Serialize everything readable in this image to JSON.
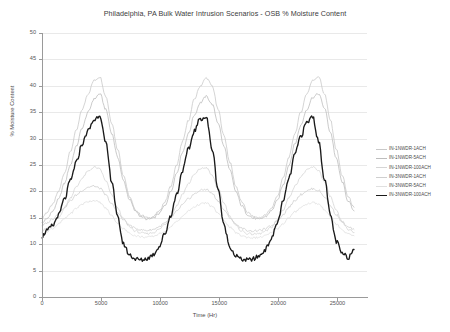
{
  "chart_data": {
    "type": "line",
    "title": "Philadelphia, PA Bulk Water Intrusion Scenarios - OSB % Moisture Content",
    "xlabel": "Time (Hr)",
    "ylabel": "% Moisture Content",
    "xlim": [
      0,
      27500
    ],
    "ylim": [
      0,
      50
    ],
    "xticks": [
      0,
      5000,
      10000,
      15000,
      20000,
      25000
    ],
    "yticks": [
      0,
      5,
      10,
      15,
      20,
      25,
      30,
      35,
      40,
      45,
      50
    ],
    "grid": "horizontal",
    "legend_position": "right",
    "series": [
      {
        "name": "IN-1NWDR-1ACH",
        "color": "#c9c9c9",
        "width": 0.8,
        "x": [
          0,
          400,
          900,
          1400,
          1900,
          2400,
          2900,
          3400,
          3900,
          4400,
          4900,
          5400,
          5900,
          6400,
          6900,
          7400,
          7900,
          8400,
          8900,
          9400,
          9900,
          10400,
          10900,
          11400,
          11900,
          12400,
          12900,
          13400,
          13900,
          14400,
          14900,
          15400,
          15900,
          16400,
          16900,
          17400,
          17900,
          18400,
          18900,
          19400,
          19900,
          20400,
          20900,
          21400,
          21900,
          22400,
          22900,
          23400,
          23900,
          24400,
          24900,
          25400,
          25900,
          26400
        ],
        "values": [
          15.0,
          16.0,
          17.5,
          20.0,
          23.5,
          27.5,
          31.5,
          35.5,
          38.5,
          41.0,
          41.7,
          38.0,
          33.0,
          28.0,
          23.0,
          19.0,
          16.5,
          15.5,
          15.0,
          15.2,
          16.2,
          18.0,
          21.0,
          25.0,
          29.5,
          33.5,
          37.5,
          40.0,
          41.5,
          40.0,
          35.5,
          30.5,
          25.5,
          21.0,
          18.0,
          16.0,
          15.2,
          15.0,
          15.5,
          16.8,
          19.0,
          22.5,
          26.5,
          31.0,
          35.0,
          38.5,
          41.0,
          41.8,
          38.5,
          33.5,
          28.0,
          23.0,
          19.0,
          17.0
        ]
      },
      {
        "name": "IN-1NWDR-5ACH",
        "color": "#bdbdbd",
        "width": 0.8,
        "x": [
          0,
          400,
          900,
          1400,
          1900,
          2400,
          2900,
          3400,
          3900,
          4400,
          4900,
          5400,
          5900,
          6400,
          6900,
          7400,
          7900,
          8400,
          8900,
          9400,
          9900,
          10400,
          10900,
          11400,
          11900,
          12400,
          12900,
          13400,
          13900,
          14400,
          14900,
          15400,
          15900,
          16400,
          16900,
          17400,
          17900,
          18400,
          18900,
          19400,
          19900,
          20400,
          20900,
          21400,
          21900,
          22400,
          22900,
          23400,
          23900,
          24400,
          24900,
          25400,
          25900,
          26400
        ],
        "values": [
          14.0,
          14.8,
          16.2,
          18.5,
          21.5,
          25.0,
          28.5,
          32.0,
          35.0,
          37.5,
          38.5,
          35.5,
          31.0,
          26.5,
          22.0,
          18.5,
          16.3,
          15.2,
          14.7,
          14.9,
          15.8,
          17.3,
          20.0,
          23.5,
          27.5,
          31.0,
          34.5,
          36.8,
          38.0,
          36.5,
          33.0,
          28.5,
          24.0,
          20.0,
          17.3,
          15.6,
          14.9,
          14.7,
          15.2,
          16.3,
          18.2,
          21.2,
          25.0,
          29.0,
          32.5,
          35.5,
          37.8,
          38.5,
          35.8,
          31.2,
          26.2,
          21.8,
          18.2,
          16.3
        ]
      },
      {
        "name": "IN-1NWDR-100ACH",
        "color": "#d5d5d5",
        "width": 0.8,
        "x": [
          0,
          400,
          900,
          1400,
          1900,
          2400,
          2900,
          3400,
          3900,
          4400,
          4900,
          5400,
          5900,
          6400,
          6900,
          7400,
          7900,
          8400,
          8900,
          9400,
          9900,
          10400,
          10900,
          11400,
          11900,
          12400,
          12900,
          13400,
          13900,
          14400,
          14900,
          15400,
          15900,
          16400,
          16900,
          17400,
          17900,
          18400,
          18900,
          19400,
          19900,
          20400,
          20900,
          21400,
          21900,
          22400,
          22900,
          23400,
          23900,
          24400,
          24900,
          25400,
          25900,
          26400
        ],
        "values": [
          12.5,
          13.0,
          13.8,
          15.0,
          16.8,
          18.8,
          20.8,
          22.5,
          23.8,
          24.6,
          24.2,
          22.0,
          19.3,
          16.8,
          14.8,
          13.3,
          12.5,
          12.1,
          12.0,
          12.2,
          12.8,
          13.8,
          15.3,
          17.3,
          19.5,
          21.5,
          23.2,
          24.3,
          24.5,
          23.0,
          20.5,
          17.8,
          15.3,
          13.5,
          12.5,
          12.0,
          11.9,
          12.0,
          12.4,
          13.2,
          14.5,
          16.5,
          18.8,
          21.0,
          22.8,
          24.0,
          24.6,
          24.0,
          21.8,
          19.0,
          16.3,
          14.2,
          12.8,
          12.2
        ]
      },
      {
        "name": "IN-3NWDR-1ACH",
        "color": "#cfcfcf",
        "width": 0.8,
        "x": [
          0,
          400,
          900,
          1400,
          1900,
          2400,
          2900,
          3400,
          3900,
          4400,
          4900,
          5400,
          5900,
          6400,
          6900,
          7400,
          7900,
          8400,
          8900,
          9400,
          9900,
          10400,
          10900,
          11400,
          11900,
          12400,
          12900,
          13400,
          13900,
          14400,
          14900,
          15400,
          15900,
          16400,
          16900,
          17400,
          17900,
          18400,
          18900,
          19400,
          19900,
          20400,
          20900,
          21400,
          21900,
          22400,
          22900,
          23400,
          23900,
          24400,
          24900,
          25400,
          25900,
          26400
        ],
        "values": [
          13.5,
          14.0,
          14.8,
          15.8,
          17.0,
          18.2,
          19.3,
          20.2,
          20.8,
          21.0,
          20.6,
          19.3,
          17.6,
          16.0,
          14.6,
          13.6,
          13.0,
          12.7,
          12.6,
          12.8,
          13.3,
          14.0,
          15.0,
          16.2,
          17.5,
          18.6,
          19.5,
          20.2,
          20.4,
          19.6,
          18.2,
          16.5,
          15.0,
          13.8,
          13.0,
          12.6,
          12.5,
          12.6,
          12.9,
          13.5,
          14.4,
          15.6,
          17.0,
          18.3,
          19.4,
          20.1,
          20.5,
          20.2,
          19.0,
          17.3,
          15.6,
          14.2,
          13.2,
          12.8
        ]
      },
      {
        "name": "IN-3NWDR-5ACH",
        "color": "#e0e0e0",
        "width": 0.8,
        "x": [
          0,
          400,
          900,
          1400,
          1900,
          2400,
          2900,
          3400,
          3900,
          4400,
          4900,
          5400,
          5900,
          6400,
          6900,
          7400,
          7900,
          8400,
          8900,
          9400,
          9900,
          10400,
          10900,
          11400,
          11900,
          12400,
          12900,
          13400,
          13900,
          14400,
          14900,
          15400,
          15900,
          16400,
          16900,
          17400,
          17900,
          18400,
          18900,
          19400,
          19900,
          20400,
          20900,
          21400,
          21900,
          22400,
          22900,
          23400,
          23900,
          24400,
          24900,
          25400,
          25900,
          26400
        ],
        "values": [
          12.0,
          12.4,
          13.0,
          13.8,
          14.8,
          15.8,
          16.8,
          17.6,
          18.1,
          18.3,
          17.9,
          16.8,
          15.4,
          14.0,
          12.9,
          12.1,
          11.6,
          11.4,
          11.3,
          11.5,
          11.9,
          12.5,
          13.3,
          14.3,
          15.3,
          16.3,
          17.1,
          17.6,
          17.8,
          17.1,
          15.9,
          14.5,
          13.2,
          12.2,
          11.6,
          11.3,
          11.2,
          11.3,
          11.6,
          12.1,
          12.9,
          13.9,
          15.0,
          16.1,
          17.0,
          17.6,
          17.9,
          17.6,
          16.6,
          15.2,
          13.8,
          12.7,
          11.9,
          11.6
        ]
      },
      {
        "name": "IN-3NWDR-100ACH",
        "color": "#1a1a1a",
        "width": 1.35,
        "x": [
          0,
          400,
          900,
          1400,
          1900,
          2400,
          2900,
          3400,
          3900,
          4400,
          4900,
          5400,
          5900,
          6400,
          6900,
          7400,
          7900,
          8400,
          8900,
          9400,
          9900,
          10400,
          10900,
          11400,
          11900,
          12400,
          12900,
          13400,
          13900,
          14400,
          14900,
          15400,
          15900,
          16400,
          16900,
          17400,
          17900,
          18400,
          18900,
          19400,
          19900,
          20400,
          20900,
          21400,
          21900,
          22400,
          22900,
          23400,
          23900,
          24400,
          24900,
          25400,
          25900,
          26400
        ],
        "values": [
          11.5,
          12.5,
          13.5,
          15.5,
          18.5,
          22.0,
          25.5,
          29.0,
          31.5,
          33.5,
          34.5,
          29.0,
          22.0,
          15.0,
          10.0,
          8.0,
          7.2,
          7.0,
          7.3,
          8.0,
          9.5,
          12.0,
          15.5,
          19.5,
          24.0,
          28.0,
          31.5,
          33.8,
          34.0,
          28.0,
          20.5,
          13.5,
          9.5,
          7.8,
          7.1,
          7.0,
          7.2,
          7.8,
          9.0,
          11.0,
          14.0,
          18.0,
          22.5,
          27.0,
          30.5,
          33.0,
          34.2,
          29.5,
          22.5,
          15.5,
          10.5,
          8.2,
          7.5,
          9.0
        ]
      }
    ]
  }
}
